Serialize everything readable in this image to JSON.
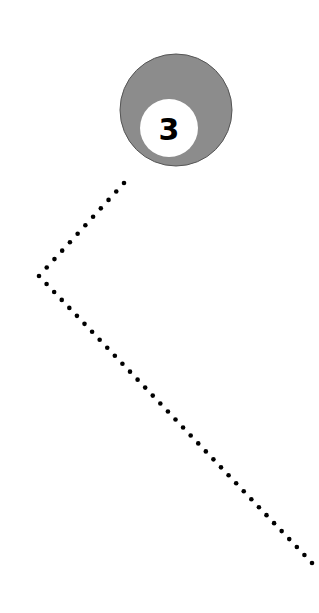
{
  "ball": {
    "number": "3",
    "cx": 176,
    "cy": 110,
    "r": 56,
    "color": "#8c8c8c",
    "spot_cx": 169,
    "spot_cy": 128,
    "spot_r": 29,
    "spot_color": "#ffffff",
    "number_color": "#000000"
  },
  "trajectory": {
    "dot_color": "#000000",
    "dot_radius": 2.3,
    "points": [
      [
        124,
        183
      ],
      [
        39,
        276
      ],
      [
        312,
        563
      ]
    ],
    "spacing": 11
  }
}
